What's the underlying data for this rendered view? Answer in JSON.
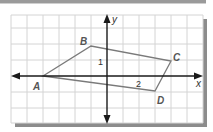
{
  "diagram": {
    "type": "coordinate-plane-quadrilateral",
    "axes": {
      "x_label": "x",
      "y_label": "y",
      "tick_labels": [
        {
          "axis": "y",
          "value": 1,
          "text": "1"
        },
        {
          "axis": "x",
          "value": 2,
          "text": "2"
        }
      ]
    },
    "grid": {
      "x_range": [
        -6,
        6
      ],
      "y_range": [
        -3,
        4
      ],
      "unit": 1
    },
    "vertices": [
      {
        "label": "A",
        "x": -4,
        "y": 0
      },
      {
        "label": "B",
        "x": -1,
        "y": 2
      },
      {
        "label": "C",
        "x": 4,
        "y": 1
      },
      {
        "label": "D",
        "x": 3,
        "y": -1
      }
    ],
    "colors": {
      "grid": "#d4d4d4",
      "axis": "#1a1a1a",
      "polygon": "#7a7a7a",
      "label": "#555555",
      "frame_shadow": "#8c8c8c"
    }
  }
}
